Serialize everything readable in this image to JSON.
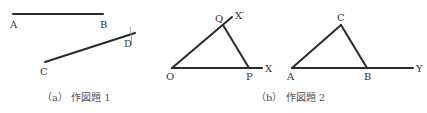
{
  "figure_a": {
    "caption": "（a）  作図題 1",
    "labels": {
      "A": "A",
      "B": "B",
      "C": "C",
      "D": "D"
    },
    "segments": [
      {
        "name": "AB",
        "from": [
          13,
          14
        ],
        "to": [
          103,
          14
        ]
      },
      {
        "name": "CD",
        "from": [
          45,
          62
        ],
        "to": [
          135,
          33
        ]
      }
    ]
  },
  "figure_b": {
    "caption": "（b）  作図題 2",
    "left": {
      "labels": {
        "O": "O",
        "P": "P",
        "Q": "Q",
        "X": "X",
        "Xp": "X′"
      },
      "segments": [
        {
          "name": "OX",
          "from": [
            172,
            68
          ],
          "to": [
            262,
            68
          ]
        },
        {
          "name": "OX'",
          "from": [
            172,
            68
          ],
          "to": [
            232,
            17
          ]
        },
        {
          "name": "QP",
          "from": [
            223,
            25
          ],
          "to": [
            249,
            68
          ]
        }
      ]
    },
    "right": {
      "labels": {
        "A": "A",
        "B": "B",
        "C": "C",
        "Y": "Y"
      },
      "segments": [
        {
          "name": "AY",
          "from": [
            292,
            68
          ],
          "to": [
            413,
            68
          ]
        },
        {
          "name": "AC",
          "from": [
            292,
            68
          ],
          "to": [
            341,
            25
          ]
        },
        {
          "name": "CB",
          "from": [
            341,
            25
          ],
          "to": [
            367,
            68
          ]
        }
      ]
    }
  }
}
